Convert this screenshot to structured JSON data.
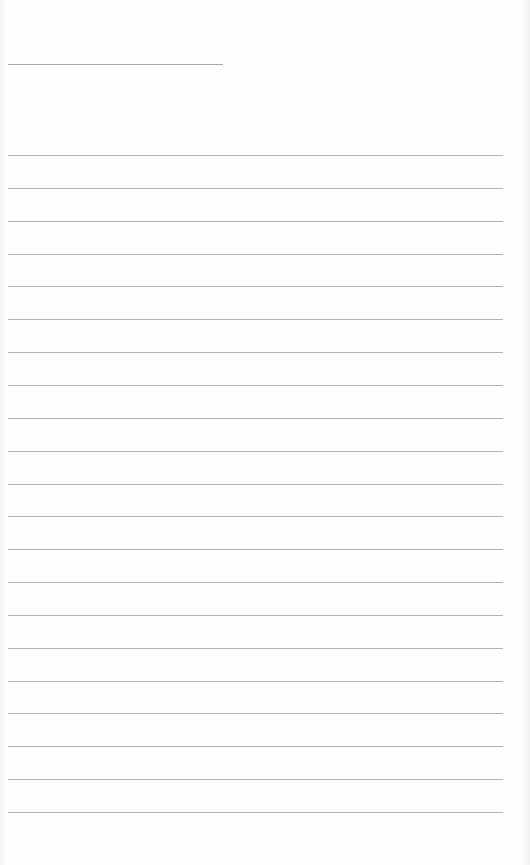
{
  "page": {
    "type": "lined-paper",
    "background_color": "#fefefe",
    "line_color": "#b2b2b2"
  },
  "header_line": {
    "x_start": 8,
    "x_end": 223,
    "y": 64
  },
  "ruled_lines": {
    "count": 21,
    "x_start": 8,
    "x_end": 503,
    "first_y": 155,
    "last_y": 812
  }
}
